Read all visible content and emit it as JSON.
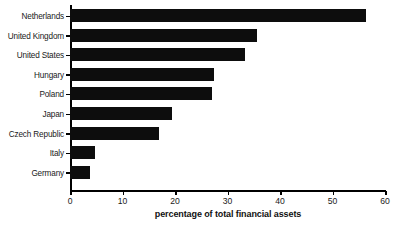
{
  "chart_data": {
    "type": "bar",
    "orientation": "horizontal",
    "title": "",
    "xlabel": "percentage of total financial assets",
    "ylabel": "",
    "categories": [
      "Netherlands",
      "United Kingdom",
      "United States",
      "Hungary",
      "Poland",
      "Japan",
      "Czech Republic",
      "Italy",
      "Germany"
    ],
    "values": [
      56.4,
      35.6,
      33.3,
      27.4,
      27.1,
      19.4,
      17.0,
      4.8,
      3.9
    ],
    "xlim": [
      0,
      60
    ],
    "xticks": [
      0,
      10,
      20,
      30,
      40,
      50,
      60
    ],
    "xtick_labels": [
      "0",
      "10",
      "20",
      "30",
      "40",
      "50",
      "60"
    ],
    "grid": false,
    "legend": false,
    "bar_color": "#0d0d0d",
    "background_color": "#ffffff",
    "axis_color": "#000000"
  }
}
